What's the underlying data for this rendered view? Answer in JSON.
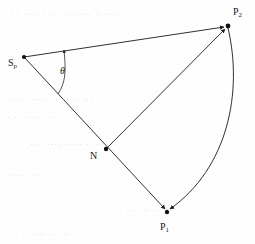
{
  "figure": {
    "type": "geometric-diagram",
    "background_color": "#fefefe",
    "stroke_color": "#1a1a1e",
    "nodes": [
      {
        "id": "Sp",
        "label": "S",
        "subscript": "p",
        "x": 24,
        "y": 57,
        "label_x": 8,
        "label_y": 57
      },
      {
        "id": "P2",
        "label": "P",
        "subscript": "2",
        "x": 228,
        "y": 26,
        "label_x": 233,
        "label_y": 6
      },
      {
        "id": "N",
        "label": "N",
        "subscript": "",
        "x": 106,
        "y": 149,
        "label_x": 90,
        "label_y": 150
      },
      {
        "id": "P1",
        "label": "P",
        "subscript": "1",
        "x": 167,
        "y": 212,
        "label_x": 160,
        "label_y": 221
      }
    ],
    "segments": [
      {
        "id": "sp-p2",
        "from": "Sp",
        "to": "P2",
        "arrowhead_at": "P2",
        "style": "straight"
      },
      {
        "id": "sp-p1",
        "from": "Sp",
        "to": "P1",
        "arrowhead_at": "P1",
        "style": "straight",
        "passes_through": "N"
      },
      {
        "id": "n-p2",
        "from": "N",
        "to": "P2",
        "arrowhead_at": "P2",
        "style": "straight"
      },
      {
        "id": "p2-p1",
        "from": "P2",
        "to": "P1",
        "arrowhead_at": "P1",
        "style": "curved",
        "bulge": "right"
      }
    ],
    "angle": {
      "id": "theta",
      "at_node": "Sp",
      "symbol": "θ",
      "label_x": 60,
      "label_y": 65,
      "arrowhead_at": "upper-ray",
      "radius": 44
    },
    "ghost_text_lines": [
      {
        "text": "· ·   ·· ·· · ··· ··  ·····  ·· ····",
        "x": 10,
        "y": 16
      },
      {
        "text": "··· ··   ···· · ····· ·· ···",
        "x": 4,
        "y": 101
      },
      {
        "text": "·· ··  ·· ··· ··",
        "x": 4,
        "y": 119
      },
      {
        "text": "···· ···· ····· ·· ·····",
        "x": 30,
        "y": 146
      },
      {
        "text": "·· ··· ··",
        "x": 8,
        "y": 177
      },
      {
        "text": "··· ···  ·· ···",
        "x": 126,
        "y": 212
      },
      {
        "text": "·· ···· ··· ··",
        "x": 22,
        "y": 236
      }
    ]
  }
}
